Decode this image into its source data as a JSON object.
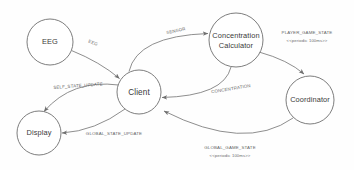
{
  "diagram": {
    "background_color": "#fefefe",
    "node_stroke_color": "#6e6e6e",
    "edge_stroke_color": "#7a7a7a",
    "label_color": "#3a3a3a",
    "edge_label_color": "#666666",
    "nodes": [
      {
        "id": "eeg",
        "label": "EEG",
        "cx": 50,
        "cy": 42,
        "r": 23
      },
      {
        "id": "client",
        "label": "Client",
        "cx": 139,
        "cy": 92,
        "r": 22
      },
      {
        "id": "concentration",
        "label_line1": "Concentration",
        "label_line2": "Calculator",
        "cx": 236,
        "cy": 40,
        "r": 27
      },
      {
        "id": "coordinator",
        "label": "Coordinator",
        "cx": 310,
        "cy": 100,
        "r": 24
      },
      {
        "id": "display",
        "label": "Display",
        "cx": 39,
        "cy": 133,
        "r": 22
      }
    ],
    "edges": [
      {
        "id": "eeg-to-client",
        "from": "eeg",
        "to": "client",
        "label": "EEG",
        "stereotype": ""
      },
      {
        "id": "client-to-concentration",
        "from": "client",
        "to": "concentration",
        "label": "SENSOR",
        "stereotype": ""
      },
      {
        "id": "concentration-to-client",
        "from": "concentration",
        "to": "client",
        "label": "CONCENTRATION",
        "stereotype": ""
      },
      {
        "id": "concentration-to-coordinator",
        "from": "concentration",
        "to": "coordinator",
        "label": "PLAYER_GAME_STATE",
        "stereotype": "<<periodic 100ms>>"
      },
      {
        "id": "coordinator-to-client",
        "from": "coordinator",
        "to": "client",
        "label": "GLOBAL_GAME_STATE",
        "stereotype": "<<periodic 100ms>>"
      },
      {
        "id": "client-to-display-self",
        "from": "client",
        "to": "display",
        "label": "SELF_STATE_UPDATE",
        "stereotype": ""
      },
      {
        "id": "client-to-display-global",
        "from": "client",
        "to": "display",
        "label": "GLOBAL_STATE_UPDATE",
        "stereotype": ""
      }
    ]
  }
}
